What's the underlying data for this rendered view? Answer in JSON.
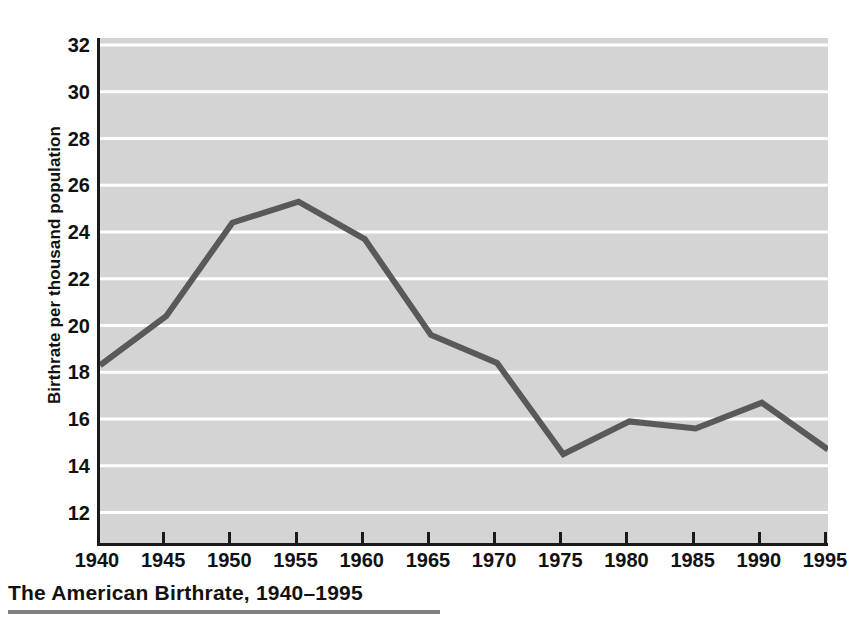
{
  "caption": {
    "title": "The American Birthrate, 1940–1995"
  },
  "colors": {
    "plot_background": "#d4d4d4",
    "gridline": "#ffffff",
    "line": "#595959",
    "axis": "#1a1a1a",
    "text": "#111111",
    "rule": "#808080"
  },
  "chart_data": {
    "type": "line",
    "title": "The American Birthrate, 1940–1995",
    "xlabel": "",
    "ylabel": "Birthrate per thousand population",
    "x": [
      1940,
      1945,
      1950,
      1955,
      1960,
      1965,
      1970,
      1975,
      1980,
      1985,
      1990,
      1995
    ],
    "values": [
      18.3,
      20.4,
      24.4,
      25.3,
      23.7,
      19.6,
      18.4,
      14.5,
      15.9,
      15.6,
      16.7,
      14.7
    ],
    "xlim": [
      1940,
      1995
    ],
    "ylim": [
      10.7,
      32.3
    ],
    "xticks": [
      "1940",
      "1945",
      "1950",
      "1955",
      "1960",
      "1965",
      "1970",
      "1975",
      "1980",
      "1985",
      "1990",
      "1995"
    ],
    "yticks": [
      32,
      30,
      28,
      26,
      24,
      22,
      20,
      18,
      16,
      14,
      12
    ],
    "ytick_labels": [
      "32",
      "30",
      "28",
      "26",
      "24",
      "22",
      "20",
      "18",
      "16",
      "14",
      "12"
    ],
    "grid": "horizontal",
    "legend": "none"
  }
}
